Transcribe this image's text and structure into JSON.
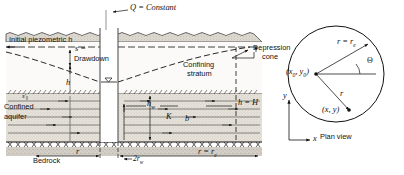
{
  "figure": {
    "colors": {
      "ink": "#111111",
      "ground_fill": "#d8d4cc",
      "aquifer_fill": "#e2ded6",
      "bedrock_fill": "#cfcbc3",
      "dash": "#1a1a1a"
    }
  },
  "cross_section": {
    "pumping_rate_label": "Q = Constant",
    "pumping_rate_symbol": "Q",
    "pumping_rate_value": "Constant",
    "initial_piezometric_label": "Initial piezometric h",
    "drawdown_symbol": "s =",
    "drawdown_label": "Drawdown",
    "depression_cone_label": "Depression cone",
    "confining_stratum_label": "Confining stratum",
    "confined_aquifer_label": "Confined aquifer",
    "bedrock_label": "Bedrock",
    "head_h_label": "h",
    "head_hw_label": "hw",
    "hydraulic_conductivity_label": "K",
    "aquifer_thickness_label": "b",
    "boundary_head_label": "h = H",
    "skin_label": "s'",
    "radius_label": "r",
    "well_diameter_label": "2rw",
    "influence_radius_label": "r = re"
  },
  "plan_view": {
    "caption": "Plan view",
    "center_label": "(x0, y0)",
    "point_label": "(x, y)",
    "radius_to_edge_label": "r = re",
    "radius_label": "r",
    "angle_label": "Θ",
    "axis_x_label": "x",
    "axis_y_label": "y"
  }
}
